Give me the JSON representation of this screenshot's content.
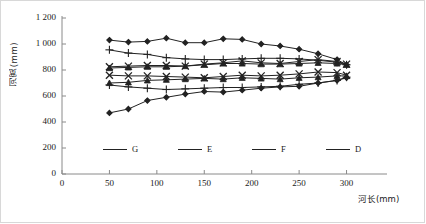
{
  "chart_data": {
    "type": "line",
    "title": "",
    "xlabel": "河长(mm)",
    "ylabel": "河宽(mm)",
    "xlim": [
      0,
      330
    ],
    "ylim": [
      0,
      1200
    ],
    "xticks": [
      0,
      50,
      100,
      150,
      200,
      250,
      300
    ],
    "yticks": [
      "0",
      "200",
      "400",
      "600",
      "800",
      "1 000",
      "1 200"
    ],
    "ytick_values": [
      0,
      200,
      400,
      600,
      800,
      1000,
      1200
    ],
    "grid": false,
    "legend_position": "inside-bottom",
    "x": [
      50,
      70,
      90,
      110,
      130,
      150,
      170,
      190,
      210,
      230,
      250,
      270,
      290,
      300
    ],
    "series": [
      {
        "name": "G",
        "marker": "diamond",
        "band": "upper",
        "values": [
          1030,
          1015,
          1020,
          1045,
          1010,
          1010,
          1040,
          1035,
          1000,
          985,
          960,
          925,
          880,
          840
        ]
      },
      {
        "name": "D",
        "marker": "plus",
        "band": "upper",
        "values": [
          955,
          930,
          920,
          895,
          885,
          880,
          880,
          885,
          890,
          890,
          885,
          875,
          860,
          840
        ]
      },
      {
        "name": "F",
        "marker": "cross",
        "band": "upper",
        "values": [
          825,
          830,
          835,
          835,
          830,
          845,
          855,
          870,
          855,
          850,
          865,
          880,
          865,
          845
        ]
      },
      {
        "name": "E",
        "marker": "triangle",
        "band": "upper",
        "values": [
          815,
          820,
          825,
          825,
          830,
          840,
          850,
          850,
          845,
          845,
          850,
          855,
          850,
          840
        ]
      },
      {
        "name": "F",
        "marker": "cross",
        "band": "lower",
        "values": [
          760,
          755,
          755,
          750,
          745,
          740,
          750,
          760,
          755,
          760,
          770,
          785,
          780,
          760
        ]
      },
      {
        "name": "E",
        "marker": "triangle",
        "band": "lower",
        "values": [
          700,
          705,
          720,
          725,
          730,
          735,
          730,
          740,
          735,
          730,
          740,
          745,
          755,
          755
        ]
      },
      {
        "name": "D",
        "marker": "plus",
        "band": "lower",
        "values": [
          685,
          670,
          660,
          650,
          655,
          660,
          665,
          665,
          670,
          675,
          690,
          700,
          720,
          745
        ]
      },
      {
        "name": "G",
        "marker": "diamond",
        "band": "lower",
        "values": [
          470,
          500,
          565,
          590,
          615,
          635,
          630,
          645,
          660,
          670,
          675,
          700,
          720,
          740
        ]
      }
    ],
    "legend": [
      {
        "label": "G",
        "marker": "diamond"
      },
      {
        "label": "E",
        "marker": "triangle"
      },
      {
        "label": "F",
        "marker": "cross"
      },
      {
        "label": "D",
        "marker": "plus"
      }
    ],
    "colors": {
      "line": "#222222",
      "axis": "#8a8a8a",
      "text": "#1a1a1a"
    }
  }
}
